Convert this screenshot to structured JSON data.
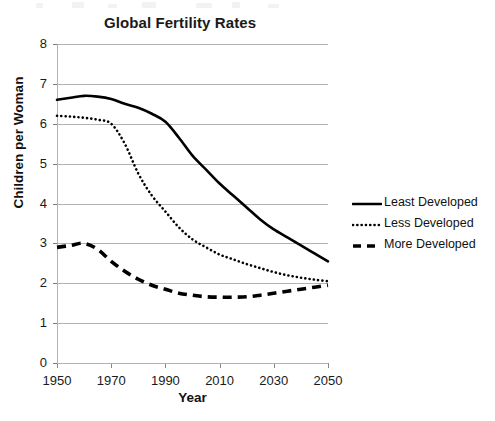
{
  "chart_data": {
    "type": "line",
    "title": "Global Fertility Rates",
    "xlabel": "Year",
    "ylabel": "Children per Woman",
    "xlim": [
      1950,
      2050
    ],
    "ylim": [
      0,
      8
    ],
    "xticks": [
      1950,
      1970,
      1990,
      2010,
      2030,
      2050
    ],
    "yticks": [
      0,
      1,
      2,
      3,
      4,
      5,
      6,
      7,
      8
    ],
    "grid": "horizontal",
    "legend_position": "right",
    "x": [
      1950,
      1955,
      1960,
      1965,
      1970,
      1975,
      1980,
      1985,
      1990,
      1995,
      2000,
      2005,
      2010,
      2015,
      2020,
      2025,
      2030,
      2035,
      2040,
      2045,
      2050
    ],
    "series": [
      {
        "name": "Least Developed",
        "style": "solid",
        "color": "#000000",
        "values": [
          6.6,
          6.65,
          6.7,
          6.68,
          6.62,
          6.5,
          6.4,
          6.25,
          6.05,
          5.65,
          5.2,
          4.85,
          4.5,
          4.2,
          3.9,
          3.6,
          3.35,
          3.15,
          2.95,
          2.75,
          2.55
        ]
      },
      {
        "name": "Less Developed",
        "style": "dotted",
        "color": "#000000",
        "values": [
          6.2,
          6.18,
          6.15,
          6.1,
          6.0,
          5.5,
          4.75,
          4.2,
          3.8,
          3.4,
          3.1,
          2.9,
          2.72,
          2.6,
          2.48,
          2.38,
          2.28,
          2.2,
          2.14,
          2.09,
          2.05
        ]
      },
      {
        "name": "More Developed",
        "style": "dashed",
        "color": "#000000",
        "values": [
          2.9,
          2.95,
          3.0,
          2.85,
          2.55,
          2.3,
          2.1,
          1.95,
          1.85,
          1.75,
          1.7,
          1.66,
          1.65,
          1.65,
          1.66,
          1.7,
          1.75,
          1.8,
          1.85,
          1.9,
          1.95
        ]
      }
    ]
  },
  "legend": {
    "items": [
      {
        "label": "Least Developed",
        "style": "solid"
      },
      {
        "label": "Less Developed",
        "style": "dotted"
      },
      {
        "label": "More Developed",
        "style": "dashed"
      }
    ]
  }
}
